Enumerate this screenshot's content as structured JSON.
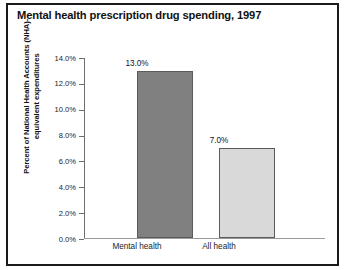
{
  "chart_data": {
    "type": "bar",
    "title": "Mental health prescription drug spending, 1997",
    "categories": [
      "Mental health",
      "All health"
    ],
    "values": [
      13.0,
      7.0
    ],
    "value_labels": [
      "13.0%",
      "7.0%"
    ],
    "xlabel": "",
    "ylabel": "Percent of National Health Accounts (NHA)-equivalent expenditures",
    "ylim": [
      0.0,
      14.0
    ],
    "ytick_labels": [
      "14.0%",
      "12.0%",
      "10.0%",
      "8.0%",
      "6.0%",
      "4.0%",
      "2.0%",
      "0.0%"
    ],
    "ytick_values": [
      14.0,
      12.0,
      10.0,
      8.0,
      6.0,
      4.0,
      2.0,
      0.0
    ],
    "grid": false,
    "legend": false,
    "bar_colors": [
      "#808080",
      "#d9d9d9"
    ],
    "bar_edge_color": "#5b5b5b",
    "axis_color": "#6e6e6e",
    "frame_color": "#1a1a1a",
    "background": "#ffffff"
  }
}
